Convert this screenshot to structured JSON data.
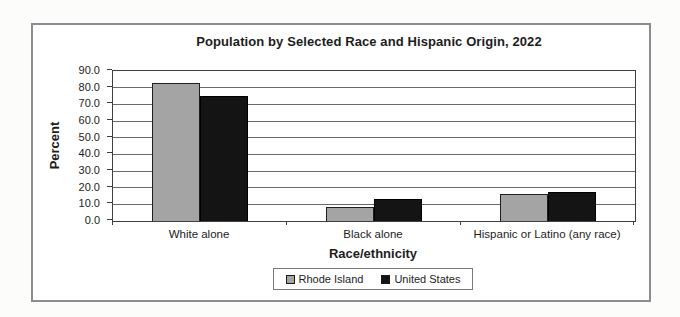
{
  "chart_data": {
    "type": "bar",
    "title": "Population by Selected Race and Hispanic Origin, 2022",
    "xlabel": "Race/ethnicity",
    "ylabel": "Percent",
    "categories": [
      "White alone",
      "Black alone",
      "Hispanic or Latino (any race)"
    ],
    "series": [
      {
        "name": "Rhode Island",
        "color": "#a4a4a4",
        "border_color": "#1f1f1f",
        "values": [
          82.5,
          8.5,
          16.0
        ]
      },
      {
        "name": "United States",
        "color": "#141414",
        "border_color": "#000000",
        "values": [
          75.0,
          13.0,
          17.5
        ]
      }
    ],
    "ylim": [
      0,
      90
    ],
    "ytick_labels": [
      "0.0",
      "10.0",
      "20.0",
      "30.0",
      "40.0",
      "50.0",
      "60.0",
      "70.0",
      "80.0",
      "90.0"
    ],
    "grid": "horizontal",
    "legend_position": "bottom",
    "plot_border_color": "#3f3f3f",
    "gridline_color": "#6a6a6a"
  }
}
